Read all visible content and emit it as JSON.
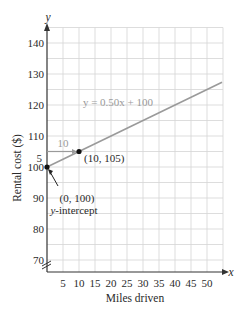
{
  "chart_data": {
    "type": "line",
    "title": "",
    "xlabel": "Miles driven",
    "ylabel": "Rental cost ($)",
    "x_axis_symbol": "x",
    "y_axis_symbol": "y",
    "xlim": [
      0,
      55
    ],
    "ylim": [
      65.8,
      145
    ],
    "y_axis_break": true,
    "grid": true,
    "x_ticks": [
      5,
      10,
      15,
      20,
      25,
      30,
      35,
      40,
      45,
      50
    ],
    "y_ticks": [
      70,
      80,
      90,
      100,
      110,
      120,
      130,
      140
    ],
    "series": [
      {
        "name": "y = 0.50x + 100",
        "equation": "y = 0.50x + 100",
        "slope": 0.5,
        "intercept": 100,
        "x": [
          0,
          54.7
        ],
        "y": [
          100,
          127.35
        ],
        "color": "#9a9a9a"
      }
    ],
    "points": [
      {
        "x": 0,
        "y": 100,
        "label": "(0, 100)",
        "sublabel": "y-intercept"
      },
      {
        "x": 10,
        "y": 105,
        "label": "(10, 105)"
      }
    ],
    "annotations": [
      {
        "type": "run",
        "text": "10",
        "from": [
          0,
          105
        ],
        "to": [
          10,
          105
        ]
      },
      {
        "type": "rise",
        "text": "5",
        "from": [
          0,
          100
        ],
        "to": [
          0,
          105
        ]
      }
    ],
    "legend": null
  }
}
